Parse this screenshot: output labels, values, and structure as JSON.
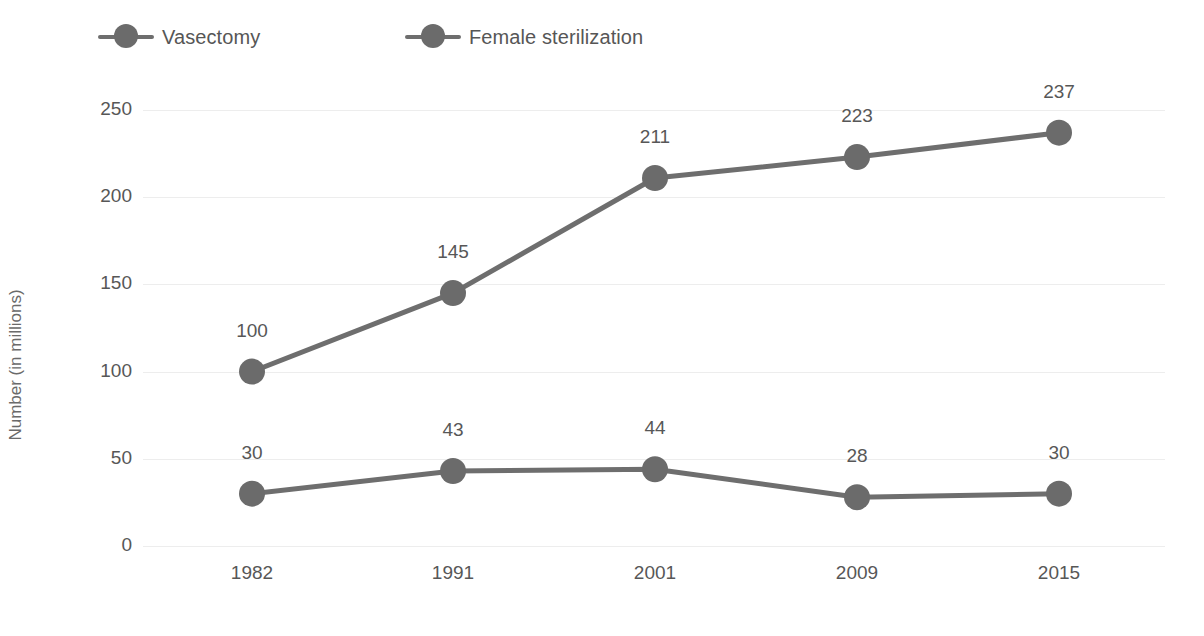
{
  "chart_data": {
    "type": "line",
    "title": "",
    "xlabel": "",
    "ylabel": "Number (in millions)",
    "categories": [
      "1982",
      "1991",
      "2001",
      "2009",
      "2015"
    ],
    "series": [
      {
        "name": "Vasectomy",
        "values": [
          30,
          43,
          44,
          28,
          30
        ],
        "color": "#6b6b6b"
      },
      {
        "name": "Female sterilization",
        "values": [
          100,
          145,
          211,
          223,
          237
        ],
        "color": "#6b6b6b"
      }
    ],
    "ylim": [
      0,
      250
    ],
    "yticks": [
      "0",
      "50",
      "100",
      "150",
      "200",
      "250"
    ],
    "grid": true,
    "legend_position": "top-left",
    "data_labels": true
  },
  "legend": {
    "items": [
      {
        "label": "Vasectomy",
        "marker": "circle-line-marker"
      },
      {
        "label": "Female sterilization",
        "marker": "circle-line-marker"
      }
    ]
  },
  "axes": {
    "y": {
      "label": "Number (in millions)",
      "ticks": [
        "0",
        "50",
        "100",
        "150",
        "200",
        "250"
      ]
    },
    "x": {
      "ticks": [
        "1982",
        "1991",
        "2001",
        "2009",
        "2015"
      ]
    }
  },
  "colors": {
    "marker": "#6b6b6b",
    "line": "#6e6e6e",
    "text": "#575757",
    "gridline": "#ededed",
    "background": "#ffffff"
  },
  "point_labels": {
    "vasectomy": [
      "30",
      "43",
      "44",
      "28",
      "30"
    ],
    "female_sterilization": [
      "100",
      "145",
      "211",
      "223",
      "237"
    ]
  }
}
